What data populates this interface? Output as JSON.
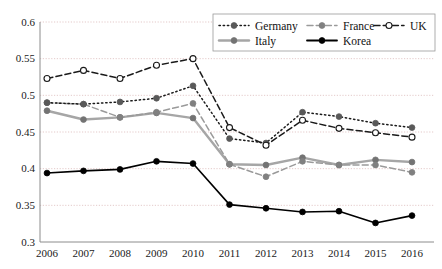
{
  "chart_data": {
    "type": "line",
    "title": "",
    "subtitle": "",
    "xlabel": "",
    "ylabel": "",
    "categories": [
      "2006",
      "2007",
      "2008",
      "2009",
      "2010",
      "2011",
      "2012",
      "2013",
      "2014",
      "2015",
      "2016"
    ],
    "x": [
      2006,
      2007,
      2008,
      2009,
      2010,
      2011,
      2012,
      2013,
      2014,
      2015,
      2016
    ],
    "ylim": [
      0.3,
      0.6
    ],
    "xlim": [
      2006,
      2016
    ],
    "yticks": [
      0.3,
      0.35,
      0.4,
      0.45,
      0.5,
      0.55,
      0.6
    ],
    "ytick_labels": [
      "0.3",
      "0.35",
      "0.4",
      "0.45",
      "0.5",
      "0.55",
      "0.6"
    ],
    "grid": true,
    "grid_axis": "y",
    "legend_position": "top-right",
    "series": [
      {
        "name": "Germany",
        "values": [
          0.49,
          0.488,
          0.491,
          0.496,
          0.513,
          0.441,
          0.435,
          0.477,
          0.471,
          0.462,
          0.456
        ],
        "color": "#1a1a1a",
        "marker": "filled-circle",
        "marker_color": "#595959",
        "line_style": "dotted"
      },
      {
        "name": "France",
        "values": [
          0.49,
          0.488,
          0.47,
          0.477,
          0.489,
          0.406,
          0.389,
          0.41,
          0.405,
          0.405,
          0.395
        ],
        "color": "#9a9a9a",
        "marker": "filled-circle",
        "marker_color": "#808080",
        "line_style": "dashed"
      },
      {
        "name": "UK",
        "values": [
          0.523,
          0.534,
          0.523,
          0.541,
          0.55,
          0.456,
          0.432,
          0.466,
          0.455,
          0.449,
          0.443
        ],
        "color": "#1a1a1a",
        "marker": "open-circle",
        "marker_color": "#ffffff",
        "line_style": "dashed"
      },
      {
        "name": "Italy",
        "values": [
          0.479,
          0.467,
          0.47,
          0.476,
          0.469,
          0.406,
          0.405,
          0.415,
          0.405,
          0.412,
          0.409
        ],
        "color": "#a6a6a6",
        "marker": "filled-circle",
        "marker_color": "#737373",
        "line_style": "solid"
      },
      {
        "name": "Korea",
        "values": [
          0.394,
          0.397,
          0.399,
          0.41,
          0.407,
          0.351,
          0.346,
          0.341,
          0.342,
          0.326,
          0.336
        ],
        "color": "#000000",
        "marker": "filled-circle",
        "marker_color": "#000000",
        "line_style": "solid"
      }
    ]
  },
  "legend": {
    "rows": [
      [
        "Germany",
        "France",
        "UK"
      ],
      [
        "Italy",
        "Korea"
      ]
    ]
  },
  "colors": {
    "grid": "#d9b3b3",
    "axis": "#8c8c8c",
    "background": "#ffffff",
    "text": "#111111"
  }
}
